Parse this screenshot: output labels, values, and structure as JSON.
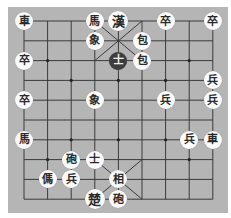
{
  "board": {
    "columns": 9,
    "rows": 10,
    "grid_origin": [
      24,
      21
    ],
    "col_spacing": 23.6,
    "row_spacing": 19.8,
    "colors": {
      "background": "#b5b5b5",
      "line": "#3a3a3a",
      "piece": "#fbfbfb",
      "selected_piece": "#3d3d3d"
    },
    "markers": [
      [
        1,
        2
      ],
      [
        7,
        2
      ],
      [
        2,
        3
      ],
      [
        4,
        3
      ],
      [
        6,
        3
      ],
      [
        2,
        6
      ],
      [
        4,
        6
      ],
      [
        6,
        6
      ],
      [
        1,
        7
      ],
      [
        7,
        7
      ]
    ]
  },
  "pieces": [
    {
      "char": "車",
      "col": 0,
      "row": 0
    },
    {
      "char": "馬",
      "col": 3,
      "row": 0
    },
    {
      "char": "漢",
      "col": 4,
      "row": 0,
      "big": true
    },
    {
      "char": "卒",
      "col": 6,
      "row": 0
    },
    {
      "char": "卒",
      "col": 8,
      "row": 0
    },
    {
      "char": "象",
      "col": 3,
      "row": 1
    },
    {
      "char": "包",
      "col": 5,
      "row": 1
    },
    {
      "char": "士",
      "col": 4,
      "row": 2,
      "selected": true
    },
    {
      "char": "包",
      "col": 5,
      "row": 2
    },
    {
      "char": "卒",
      "col": 0,
      "row": 2
    },
    {
      "char": "兵",
      "col": 8,
      "row": 3
    },
    {
      "char": "卒",
      "col": 0,
      "row": 4
    },
    {
      "char": "象",
      "col": 3,
      "row": 4
    },
    {
      "char": "兵",
      "col": 6,
      "row": 4
    },
    {
      "char": "兵",
      "col": 8,
      "row": 4
    },
    {
      "char": "馬",
      "col": 0,
      "row": 6
    },
    {
      "char": "兵",
      "col": 7,
      "row": 6
    },
    {
      "char": "車",
      "col": 8,
      "row": 6
    },
    {
      "char": "砲",
      "col": 2,
      "row": 7
    },
    {
      "char": "士",
      "col": 3,
      "row": 7
    },
    {
      "char": "傌",
      "col": 1,
      "row": 8
    },
    {
      "char": "兵",
      "col": 2,
      "row": 8
    },
    {
      "char": "相",
      "col": 4,
      "row": 8
    },
    {
      "char": "楚",
      "col": 3,
      "row": 9,
      "big": true
    },
    {
      "char": "砲",
      "col": 4,
      "row": 9
    }
  ]
}
